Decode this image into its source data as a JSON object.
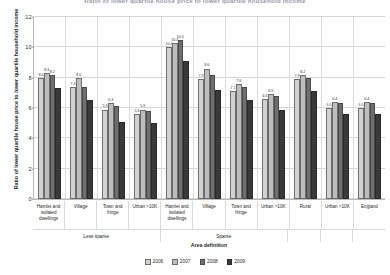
{
  "chart_data": {
    "type": "bar",
    "title": "Ratio of lower quartile house price to lower quartile household income",
    "xlabel": "Area definition",
    "ylabel": "Ratio of lower quartile house price to lower quartile household income",
    "ylim": [
      0,
      12
    ],
    "yticks": [
      0,
      2,
      4,
      6,
      8,
      10,
      12
    ],
    "grid": true,
    "legend_position": "bottom",
    "categories": [
      "Hamlet and isolated dwellings",
      "Village",
      "Town and fringe",
      "Urban >10K",
      "Hamlet and isolated dwellings",
      "Village",
      "Town and fringe",
      "Urban >10K",
      "Rural",
      "Urban >10K",
      "England"
    ],
    "groupings": [
      {
        "label": "Less sparse",
        "span": 4
      },
      {
        "label": "Sparse",
        "span": 4
      },
      {
        "label": "",
        "span": 1
      },
      {
        "label": "",
        "span": 1
      },
      {
        "label": "",
        "span": 1
      }
    ],
    "series": [
      {
        "name": "2006",
        "color": "#d2d2d2",
        "values": [
          8.0,
          7.4,
          5.9,
          5.6,
          10.0,
          7.9,
          7.1,
          6.6,
          7.9,
          6.0,
          6.0
        ]
      },
      {
        "name": "2007",
        "color": "#bdbdbd",
        "values": [
          8.3,
          8.0,
          6.3,
          5.9,
          10.3,
          8.6,
          7.6,
          6.9,
          8.2,
          6.4,
          6.4
        ]
      },
      {
        "name": "2008",
        "color": "#6e6e6e",
        "values": [
          8.2,
          7.4,
          6.1,
          5.8,
          10.5,
          8.2,
          7.4,
          6.8,
          8.0,
          6.3,
          6.3
        ]
      },
      {
        "name": "2009",
        "color": "#3a3a3a",
        "values": [
          7.3,
          6.5,
          5.1,
          5.0,
          9.1,
          7.2,
          6.5,
          5.9,
          7.1,
          5.6,
          5.6
        ]
      }
    ],
    "bar_labels": [
      [
        "8.0",
        "8.3",
        "8.2",
        ""
      ],
      [
        "7.4",
        "8.0",
        "",
        ""
      ],
      [
        "5.9",
        "6.3",
        "",
        ""
      ],
      [
        "5.6",
        "5.9",
        "",
        ""
      ],
      [
        "10.0",
        "10.3",
        "10.5",
        ""
      ],
      [
        "7.9",
        "8.6",
        "",
        ""
      ],
      [
        "7.1",
        "7.6",
        "",
        ""
      ],
      [
        "6.6",
        "6.9",
        "",
        ""
      ],
      [
        "7.9",
        "8.2",
        "",
        ""
      ],
      [
        "6.0",
        "6.4",
        "",
        ""
      ],
      [
        "6.0",
        "6.4",
        "",
        ""
      ]
    ]
  },
  "legend": {
    "items": [
      {
        "label": "2006"
      },
      {
        "label": "2007"
      },
      {
        "label": "2008"
      },
      {
        "label": "2009"
      }
    ]
  }
}
